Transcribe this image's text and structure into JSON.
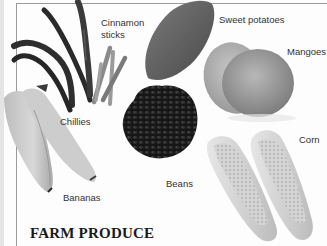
{
  "title": "FARM PRODUCE",
  "labels": {
    "cinnamon_line1": "Cinnamon",
    "cinnamon_line2": "sticks",
    "sweet_potatoes": "Sweet potatoes",
    "mangoes": "Mangoes",
    "chillies": "Chillies",
    "beans": "Beans",
    "corn": "Corn",
    "bananas": "Bananas"
  },
  "colors": {
    "background": "#fdfdfd",
    "frame_line": "#9a9a9a",
    "label_text": "#333333",
    "title_text": "#1a1a1a"
  }
}
